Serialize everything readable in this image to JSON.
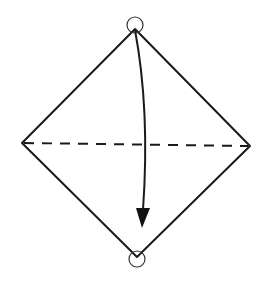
{
  "diagram": {
    "type": "origami-fold-step",
    "shape": "diamond-square",
    "vertices": {
      "top": [
        135,
        29
      ],
      "left": [
        22,
        143
      ],
      "right": [
        250,
        146
      ],
      "bottom": [
        137,
        257
      ]
    },
    "fold_line": {
      "style": "dashed",
      "kind": "valley-fold",
      "from": [
        22,
        143
      ],
      "to": [
        250,
        146
      ]
    },
    "markers": [
      {
        "name": "top-point-circle",
        "center": [
          135,
          25
        ],
        "radius": 8
      },
      {
        "name": "bottom-point-circle",
        "center": [
          137,
          259
        ],
        "radius": 8
      }
    ],
    "arrow": {
      "from": [
        135,
        30
      ],
      "to": [
        142,
        228
      ],
      "direction": "down",
      "meaning": "fold top corner down to bottom corner"
    },
    "colors": {
      "line": "#1a1a1a",
      "background": "#ffffff"
    }
  }
}
